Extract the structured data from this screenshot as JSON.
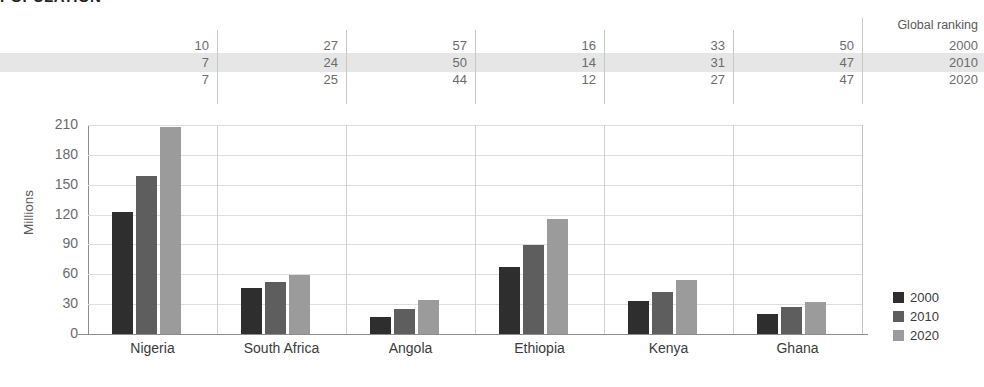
{
  "title": "POPULATION",
  "ylabel": "Millions",
  "ranking": {
    "header": "Global ranking",
    "years": [
      "2000",
      "2010",
      "2020"
    ],
    "highlight_year": "2010",
    "rows": [
      {
        "year": "2000",
        "values": [
          "10",
          "27",
          "57",
          "16",
          "33",
          "50"
        ]
      },
      {
        "year": "2010",
        "values": [
          "7",
          "24",
          "50",
          "14",
          "31",
          "47"
        ]
      },
      {
        "year": "2020",
        "values": [
          "7",
          "25",
          "44",
          "12",
          "27",
          "47"
        ]
      }
    ]
  },
  "legend": {
    "position": "right",
    "entries": [
      {
        "label": "2000",
        "color": "#2e2e2e"
      },
      {
        "label": "2010",
        "color": "#5e5e5e"
      },
      {
        "label": "2020",
        "color": "#9b9b9b"
      }
    ]
  },
  "yticks": [
    "0",
    "30",
    "60",
    "90",
    "120",
    "150",
    "180",
    "210"
  ],
  "chart_data": {
    "type": "bar",
    "title": "POPULATION",
    "subtitle": "",
    "xlabel": "",
    "ylabel": "Millions",
    "ylim": [
      0,
      210
    ],
    "yticks": [
      0,
      30,
      60,
      90,
      120,
      150,
      180,
      210
    ],
    "grid": true,
    "legend_position": "right",
    "categories": [
      "Nigeria",
      "South Africa",
      "Angola",
      "Ethiopia",
      "Kenya",
      "Ghana"
    ],
    "series": [
      {
        "name": "2000",
        "color": "#2e2e2e",
        "values": [
          123,
          46,
          17,
          67,
          33,
          20
        ]
      },
      {
        "name": "2010",
        "color": "#5e5e5e",
        "values": [
          159,
          52,
          25,
          89,
          42,
          27
        ]
      },
      {
        "name": "2020",
        "color": "#9b9b9b",
        "values": [
          208,
          59,
          34,
          116,
          54,
          32
        ]
      }
    ],
    "annotations": {
      "table_header": "Global ranking",
      "table_rows": [
        {
          "year": "2000",
          "Nigeria": 10,
          "South Africa": 27,
          "Angola": 57,
          "Ethiopia": 16,
          "Kenya": 33,
          "Ghana": 50
        },
        {
          "year": "2010",
          "Nigeria": 7,
          "South Africa": 24,
          "Angola": 50,
          "Ethiopia": 14,
          "Kenya": 31,
          "Ghana": 47
        },
        {
          "year": "2020",
          "Nigeria": 7,
          "South Africa": 25,
          "Angola": 44,
          "Ethiopia": 12,
          "Kenya": 27,
          "Ghana": 47
        }
      ]
    }
  }
}
